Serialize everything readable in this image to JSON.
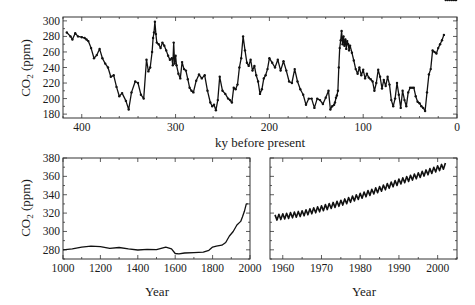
{
  "chart_data": [
    {
      "id": "vostok",
      "type": "line",
      "title": "",
      "xlabel": "ky before present",
      "ylabel": "CO2 (ppm)",
      "xlim": [
        420,
        0
      ],
      "ylim": [
        175,
        305
      ],
      "xticks": [
        400,
        300,
        200,
        100,
        0
      ],
      "yticks": [
        180,
        200,
        220,
        240,
        260,
        280,
        300
      ],
      "grid": false,
      "markers": true,
      "x": [
        416,
        412,
        410,
        407,
        404,
        400,
        397,
        395,
        393,
        390,
        387,
        384,
        381,
        378,
        375,
        372,
        369,
        366,
        363,
        360,
        357,
        353,
        350,
        347,
        343,
        340,
        337,
        334,
        331,
        329,
        327,
        325,
        324,
        323,
        322,
        321,
        320,
        318,
        316,
        314,
        312,
        310,
        308,
        306,
        304,
        303,
        302,
        301,
        300,
        299,
        297,
        295,
        293,
        291,
        289,
        287,
        285,
        283,
        281,
        278,
        275,
        272,
        269,
        266,
        263,
        261,
        259,
        257,
        255,
        253,
        250,
        247,
        244,
        242,
        240,
        238,
        236,
        234,
        232,
        230,
        228,
        226,
        224,
        222,
        220,
        218,
        216,
        214,
        212,
        210,
        208,
        206,
        204,
        202,
        200,
        197,
        194,
        191,
        188,
        185,
        182,
        179,
        176,
        173,
        170,
        167,
        164,
        161,
        158,
        155,
        152,
        149,
        146,
        143,
        140,
        137,
        135,
        133,
        131,
        130,
        129,
        128,
        127,
        126,
        125,
        124,
        123,
        122,
        121,
        120,
        119,
        118,
        117,
        116,
        115,
        114,
        112,
        110,
        108,
        106,
        104,
        102,
        100,
        98,
        96,
        94,
        92,
        90,
        88,
        86,
        84,
        82,
        80,
        78,
        76,
        74,
        72,
        70,
        68,
        66,
        64,
        62,
        60,
        58,
        56,
        54,
        52,
        50,
        48,
        46,
        44,
        42,
        40,
        38,
        36,
        34,
        32,
        30,
        28,
        26,
        24,
        22,
        20,
        18,
        16,
        14,
        12,
        10,
        8,
        6,
        4,
        2,
        1
      ],
      "y": [
        285,
        280,
        276,
        284,
        280,
        279,
        278,
        276,
        274,
        265,
        252,
        256,
        264,
        252,
        245,
        240,
        228,
        230,
        215,
        203,
        207,
        197,
        186,
        208,
        222,
        220,
        205,
        200,
        250,
        235,
        240,
        260,
        278,
        285,
        299,
        283,
        272,
        270,
        265,
        272,
        268,
        262,
        255,
        250,
        252,
        243,
        272,
        245,
        255,
        243,
        232,
        226,
        247,
        238,
        236,
        225,
        214,
        210,
        208,
        223,
        231,
        226,
        230,
        210,
        195,
        190,
        192,
        185,
        198,
        228,
        210,
        206,
        200,
        198,
        195,
        214,
        212,
        218,
        240,
        252,
        280,
        262,
        246,
        242,
        250,
        236,
        242,
        230,
        222,
        206,
        212,
        226,
        230,
        238,
        252,
        246,
        240,
        250,
        236,
        248,
        236,
        222,
        220,
        238,
        222,
        212,
        205,
        192,
        200,
        200,
        188,
        200,
        198,
        193,
        201,
        210,
        186,
        190,
        192,
        195,
        201,
        204,
        210,
        240,
        265,
        275,
        287,
        270,
        280,
        268,
        276,
        264,
        274,
        270,
        262,
        268,
        259,
        249,
        238,
        232,
        240,
        230,
        237,
        226,
        232,
        227,
        225,
        222,
        210,
        220,
        237,
        228,
        213,
        224,
        216,
        228,
        218,
        198,
        190,
        200,
        220,
        205,
        188,
        210,
        198,
        190,
        208,
        214,
        214,
        214,
        203,
        196,
        194,
        190,
        188,
        184,
        208,
        231,
        238,
        262,
        260,
        258,
        265,
        270,
        275,
        282
      ]
    },
    {
      "id": "law-dome",
      "type": "line",
      "title": "",
      "xlabel": "Year",
      "ylabel": "CO2 (ppm)",
      "xlim": [
        1000,
        2000
      ],
      "ylim": [
        270,
        380
      ],
      "xticks": [
        1000,
        1200,
        1400,
        1600,
        1800,
        2000
      ],
      "yticks": [
        280,
        300,
        320,
        340,
        360,
        380
      ],
      "grid": false,
      "markers": false,
      "x": [
        1000,
        1050,
        1100,
        1150,
        1200,
        1250,
        1300,
        1350,
        1400,
        1450,
        1500,
        1550,
        1580,
        1600,
        1620,
        1650,
        1700,
        1750,
        1780,
        1800,
        1820,
        1850,
        1870,
        1890,
        1910,
        1930,
        1950,
        1960,
        1970,
        1980,
        1990
      ],
      "y": [
        280,
        281,
        283,
        284,
        283.5,
        281.5,
        282.5,
        281,
        279.8,
        280.5,
        280.2,
        283,
        281,
        276,
        275.5,
        276.5,
        277,
        277.5,
        279.5,
        283,
        284,
        285,
        288,
        295,
        300,
        307,
        311,
        316,
        322,
        330,
        330
      ]
    },
    {
      "id": "mauna-loa",
      "type": "line",
      "title": "",
      "xlabel": "Year",
      "ylabel": "",
      "xlim": [
        1956.7,
        2005
      ],
      "ylim": [
        270,
        380
      ],
      "xticks": [
        1960,
        1970,
        1980,
        1990,
        2000
      ],
      "yticks": [
        280,
        300,
        320,
        340,
        360,
        380
      ],
      "grid": false,
      "markers": false,
      "seasonal_amplitude_ppm": 6,
      "trend_start": {
        "year": 1958,
        "ppm": 315
      },
      "trend_end": {
        "year": 2002,
        "ppm": 372
      },
      "trend_x": [
        1958,
        1965,
        1970,
        1975,
        1980,
        1985,
        1990,
        1995,
        2002
      ],
      "trend_y": [
        315,
        319.5,
        325,
        331,
        338.5,
        346,
        354,
        361,
        371.5
      ]
    }
  ],
  "labels": {
    "top_ylabel_main": "CO",
    "top_ylabel_sub": "2",
    "top_ylabel_unit": " (ppm)",
    "top_xlabel": "ky before present",
    "bl_xlabel": "Year",
    "br_xlabel": "Year"
  }
}
